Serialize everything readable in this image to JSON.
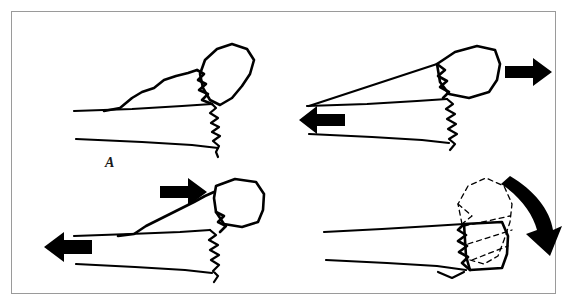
{
  "figure": {
    "background_color": "#ffffff",
    "frame_color": "#9a9a9a",
    "ink_color": "#000000",
    "panel_count": 4
  },
  "panels": [
    {
      "id": "A",
      "label": "A",
      "name": "panel-a",
      "caption": "Angulated fracture fragment tilted away from shaft, no applied force arrows",
      "arrows": [],
      "fragment_style": "solid",
      "ghost_outline": false
    },
    {
      "id": "B",
      "label": "B",
      "name": "panel-b",
      "caption": "Distraction: distal fragment pulled right, proximal shaft pulled left",
      "arrows": [
        {
          "name": "arrow-right",
          "direction": "right",
          "style": "straight",
          "position": "upper-right"
        },
        {
          "name": "arrow-left",
          "direction": "left",
          "style": "straight",
          "position": "mid-left"
        }
      ],
      "fragment_style": "solid",
      "ghost_outline": false
    },
    {
      "id": "C",
      "label": "C",
      "name": "panel-c",
      "caption": "Impaction/override: fragment driven left into shaft while shaft moves left",
      "arrows": [
        {
          "name": "arrow-right",
          "direction": "right",
          "style": "straight",
          "position": "upper-left"
        },
        {
          "name": "arrow-left",
          "direction": "left",
          "style": "straight",
          "position": "mid-left"
        }
      ],
      "fragment_style": "solid",
      "ghost_outline": false
    },
    {
      "id": "D",
      "label": "D",
      "name": "panel-d",
      "caption": "Rotation: fragment rotates clockwise, dashed ghost shows original position",
      "arrows": [
        {
          "name": "arrow-curved-clockwise",
          "direction": "clockwise",
          "style": "curved",
          "position": "upper-right"
        }
      ],
      "fragment_style": "solid",
      "ghost_outline": true
    }
  ]
}
